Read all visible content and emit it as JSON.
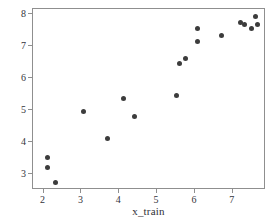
{
  "chart_data": {
    "type": "scatter",
    "title": "",
    "xlabel": "x_train",
    "ylabel": "y_train",
    "xlim": [
      1.72,
      7.88
    ],
    "ylim": [
      2.5,
      8.15
    ],
    "xticks": [
      2,
      3,
      4,
      5,
      6,
      7
    ],
    "yticks": [
      3,
      4,
      5,
      6,
      7,
      8
    ],
    "xtick_labels": [
      "2",
      "3",
      "4",
      "5",
      "6",
      "7"
    ],
    "ytick_labels": [
      "3",
      "4",
      "5",
      "6",
      "7",
      "8"
    ],
    "grid": false,
    "legend": null,
    "marker_color": "#3c3c3c",
    "marker_size": 5,
    "frame_color": "#8f8f8f",
    "background": "#ffffff",
    "points": [
      {
        "x": 2.1,
        "y": 3.52
      },
      {
        "x": 2.1,
        "y": 3.2
      },
      {
        "x": 2.32,
        "y": 2.72
      },
      {
        "x": 3.06,
        "y": 4.94
      },
      {
        "x": 3.7,
        "y": 4.12
      },
      {
        "x": 4.1,
        "y": 5.35
      },
      {
        "x": 4.4,
        "y": 4.8
      },
      {
        "x": 5.52,
        "y": 5.45
      },
      {
        "x": 5.6,
        "y": 6.44
      },
      {
        "x": 5.74,
        "y": 6.62
      },
      {
        "x": 6.06,
        "y": 7.53
      },
      {
        "x": 6.06,
        "y": 7.15
      },
      {
        "x": 6.7,
        "y": 7.33
      },
      {
        "x": 7.2,
        "y": 7.72
      },
      {
        "x": 7.3,
        "y": 7.66
      },
      {
        "x": 7.5,
        "y": 7.53
      },
      {
        "x": 7.6,
        "y": 7.92
      },
      {
        "x": 7.66,
        "y": 7.66
      }
    ]
  }
}
